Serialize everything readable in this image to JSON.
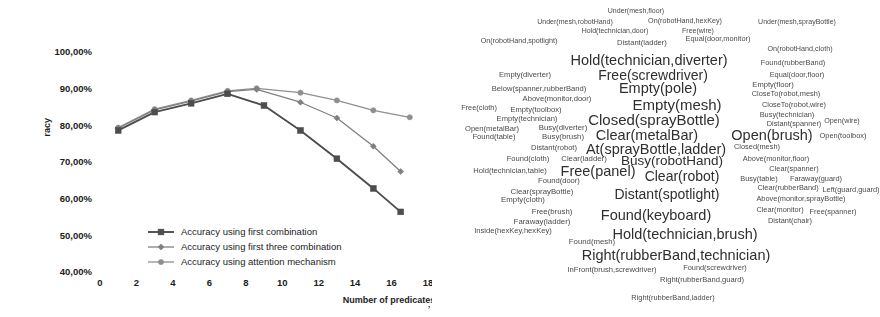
{
  "chart_data": {
    "type": "line",
    "title": "",
    "xlabel": "Number of predicates",
    "ylabel": "racy",
    "x": [
      1,
      3,
      5,
      7,
      9,
      11,
      13,
      15
    ],
    "xticks": [
      "0",
      "2",
      "4",
      "6",
      "8",
      "10",
      "12",
      "14",
      "16",
      "18"
    ],
    "xtick_values": [
      0,
      2,
      4,
      6,
      8,
      10,
      12,
      14,
      16,
      18
    ],
    "yticks": [
      "40,00%",
      "50,00%",
      "60,00%",
      "70,00%",
      "80,00%",
      "90,00%",
      "100,00%"
    ],
    "ytick_values": [
      40,
      50,
      60,
      70,
      80,
      90,
      100
    ],
    "xlim": [
      0,
      18
    ],
    "ylim": [
      40,
      100
    ],
    "grid": false,
    "legend_position": "lower center",
    "series": [
      {
        "name": "Accuracy using first combination",
        "marker": "square",
        "color": "#4d4d4d",
        "values": [
          78.6,
          83.6,
          86.0,
          88.6,
          85.4,
          78.6,
          70.9,
          62.8,
          56.4
        ],
        "x": [
          1,
          3,
          5,
          7,
          9,
          11,
          13,
          15,
          16.5
        ]
      },
      {
        "name": "Accuracy using first three combination",
        "marker": "diamond",
        "color": "#808080",
        "values": [
          79.2,
          84.2,
          86.6,
          89.2,
          89.8,
          86.3,
          82.0,
          74.3,
          67.4
        ],
        "x": [
          1,
          3,
          5,
          7,
          8.6,
          11,
          13,
          15,
          16.5
        ]
      },
      {
        "name": "Accuracy using attention mechanism",
        "marker": "circle",
        "color": "#8f8f8f",
        "values": [
          79.4,
          84.4,
          86.8,
          89.4,
          90.1,
          88.9,
          86.8,
          84.1,
          82.2
        ],
        "x": [
          1,
          3,
          5,
          7,
          8.6,
          11,
          13,
          15,
          17
        ]
      }
    ],
    "stray_text": ","
  },
  "word_cloud": {
    "words": [
      {
        "text": "Under(mesh,floor)",
        "x": 204,
        "y": 12,
        "size": 7.0
      },
      {
        "text": "Under(mesh,robotHand)",
        "x": 143,
        "y": 24,
        "size": 7.0
      },
      {
        "text": "On(robotHand,hexKey)",
        "x": 253,
        "y": 24,
        "size": 7.2
      },
      {
        "text": "Under(mesh,sprayBottle)",
        "x": 365,
        "y": 24,
        "size": 7.0
      },
      {
        "text": "Hold(technician,door)",
        "x": 183,
        "y": 35,
        "size": 7.0
      },
      {
        "text": "Free(wire)",
        "x": 266,
        "y": 35,
        "size": 7.0
      },
      {
        "text": "On(robotHand,spotlight)",
        "x": 87,
        "y": 48,
        "size": 7.2
      },
      {
        "text": "Distant(ladder)",
        "x": 210,
        "y": 50,
        "size": 7.6
      },
      {
        "text": "Equal(door,monitor)",
        "x": 286,
        "y": 46,
        "size": 7.4
      },
      {
        "text": "On(robotHand,cloth)",
        "x": 368,
        "y": 57,
        "size": 7.2
      },
      {
        "text": "Hold(technician,diverter)",
        "x": 217,
        "y": 70,
        "size": 14.5
      },
      {
        "text": "Found(rubberBand)",
        "x": 361,
        "y": 73,
        "size": 7.4
      },
      {
        "text": "Empty(diverter)",
        "x": 93,
        "y": 88,
        "size": 7.6
      },
      {
        "text": "Free(screwdriver)",
        "x": 221,
        "y": 87,
        "size": 14.0
      },
      {
        "text": "Equal(door,floor)",
        "x": 365,
        "y": 88,
        "size": 7.4
      },
      {
        "text": "Below(spanner,rubberBand)",
        "x": 107,
        "y": 104,
        "size": 7.6
      },
      {
        "text": "Empty(pole)",
        "x": 226,
        "y": 103,
        "size": 14.5
      },
      {
        "text": "Empty(floor)",
        "x": 341,
        "y": 99,
        "size": 7.6
      },
      {
        "text": "CloseTo(robot,mesh)",
        "x": 354,
        "y": 110,
        "size": 7.4
      },
      {
        "text": "Above(monitor,door)",
        "x": 125,
        "y": 116,
        "size": 7.6
      },
      {
        "text": "Empty(mesh)",
        "x": 245,
        "y": 121,
        "size": 15.0
      },
      {
        "text": "CloseTo(robot,wire)",
        "x": 362,
        "y": 122,
        "size": 7.4
      },
      {
        "text": "Free(cloth)",
        "x": 47,
        "y": 126,
        "size": 7.4
      },
      {
        "text": "Empty(toolbox)",
        "x": 104,
        "y": 128,
        "size": 7.6
      },
      {
        "text": "Busy(technician)",
        "x": 355,
        "y": 134,
        "size": 7.4
      },
      {
        "text": "Closed(sprayBottle)",
        "x": 222,
        "y": 139,
        "size": 15.0
      },
      {
        "text": "Empty(technician)",
        "x": 95,
        "y": 139,
        "size": 7.6
      },
      {
        "text": "Distant(spanner)",
        "x": 362,
        "y": 145,
        "size": 7.4
      },
      {
        "text": "Open(wire)",
        "x": 410,
        "y": 141,
        "size": 7.2
      },
      {
        "text": "Open(metalBar)",
        "x": 60,
        "y": 151,
        "size": 7.6
      },
      {
        "text": "Busy(diverter)",
        "x": 131,
        "y": 149,
        "size": 7.8
      },
      {
        "text": "Clear(metalBar)",
        "x": 215,
        "y": 157,
        "size": 14.5
      },
      {
        "text": "Open(brush)",
        "x": 340,
        "y": 157,
        "size": 14.5
      },
      {
        "text": "Open(toolbox)",
        "x": 411,
        "y": 159,
        "size": 7.4
      },
      {
        "text": "Found(table)",
        "x": 62,
        "y": 160,
        "size": 7.6
      },
      {
        "text": "Busy(brush)",
        "x": 131,
        "y": 160,
        "size": 7.8
      },
      {
        "text": "At(sprayBottle,ladder)",
        "x": 224,
        "y": 174,
        "size": 14.5
      },
      {
        "text": "Closed(mesh)",
        "x": 325,
        "y": 172,
        "size": 7.4
      },
      {
        "text": "Distant(robot)",
        "x": 122,
        "y": 173,
        "size": 7.6
      },
      {
        "text": "Found(cloth)",
        "x": 96,
        "y": 186,
        "size": 7.6
      },
      {
        "text": "Clear(ladder)",
        "x": 152,
        "y": 186,
        "size": 7.8
      },
      {
        "text": "Busy(robotHand)",
        "x": 240,
        "y": 188,
        "size": 13.5
      },
      {
        "text": "Above(monitor,floor)",
        "x": 344,
        "y": 186,
        "size": 7.4
      },
      {
        "text": "Hold(technician,table)",
        "x": 78,
        "y": 200,
        "size": 7.6
      },
      {
        "text": "Free(panel)",
        "x": 166,
        "y": 200,
        "size": 14.5
      },
      {
        "text": "Clear(robot)",
        "x": 250,
        "y": 205,
        "size": 14.0
      },
      {
        "text": "Clear(spanner)",
        "x": 362,
        "y": 197,
        "size": 7.4
      },
      {
        "text": "Found(door)",
        "x": 127,
        "y": 211,
        "size": 7.6
      },
      {
        "text": "Busy(table)",
        "x": 327,
        "y": 209,
        "size": 7.4
      },
      {
        "text": "Faraway(guard)",
        "x": 384,
        "y": 209,
        "size": 7.4
      },
      {
        "text": "Clear(sprayBottle)",
        "x": 110,
        "y": 224,
        "size": 7.8
      },
      {
        "text": "Clear(rubberBand)",
        "x": 356,
        "y": 220,
        "size": 7.4
      },
      {
        "text": "Left(guard,guard)",
        "x": 419,
        "y": 222,
        "size": 7.4
      },
      {
        "text": "Distant(spotlight)",
        "x": 235,
        "y": 227,
        "size": 14.0
      },
      {
        "text": "Empty(cloth)",
        "x": 91,
        "y": 234,
        "size": 7.8
      },
      {
        "text": "Above(monitor,sprayBottle)",
        "x": 369,
        "y": 232,
        "size": 7.4
      },
      {
        "text": "Free(brush)",
        "x": 120,
        "y": 248,
        "size": 7.8
      },
      {
        "text": "Found(keyboard)",
        "x": 224,
        "y": 251,
        "size": 14.5
      },
      {
        "text": "Clear(monitor)",
        "x": 348,
        "y": 245,
        "size": 7.4
      },
      {
        "text": "Free(spanner)",
        "x": 401,
        "y": 247,
        "size": 7.4
      },
      {
        "text": "Faraway(ladder)",
        "x": 110,
        "y": 259,
        "size": 7.8
      },
      {
        "text": "Distant(chair)",
        "x": 358,
        "y": 258,
        "size": 7.4
      },
      {
        "text": "Inside(hexKey,hexKey)",
        "x": 81,
        "y": 270,
        "size": 7.6
      },
      {
        "text": "Hold(technician,brush)",
        "x": 253,
        "y": 273,
        "size": 14.5
      },
      {
        "text": "Found(mesh)",
        "x": 160,
        "y": 283,
        "size": 7.8
      },
      {
        "text": "Right(rubberBand,technician)",
        "x": 244,
        "y": 298,
        "size": 14.5
      },
      {
        "text": "InFront(brush,screwdriver)",
        "x": 180,
        "y": 315,
        "size": 7.6
      },
      {
        "text": "Found(screwdriver)",
        "x": 283,
        "y": 313,
        "size": 7.4
      },
      {
        "text": "Right(rubberBand,guard)",
        "x": 270,
        "y": 327,
        "size": 7.6
      },
      {
        "text": "Right(rubberBand,ladder)",
        "x": 241,
        "y": 348,
        "size": 7.4
      }
    ]
  }
}
